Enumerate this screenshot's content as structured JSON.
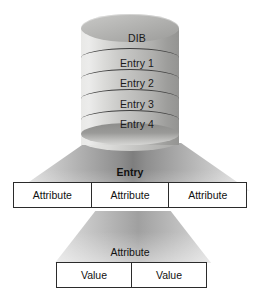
{
  "diagram": {
    "colors": {
      "box_border": "#2b2b2b",
      "box_fill": "#ffffff",
      "text": "#111111",
      "cylinder_light": "#ececeb",
      "cylinder_dark": "#949492",
      "ring_line": "#3d3d3d",
      "funnel_dark": "#7e7e7e",
      "funnel_light": "#ffffff",
      "background": "#ffffff"
    },
    "cylinder": {
      "top_label": "DIB",
      "entries": [
        {
          "label": "Entry 1"
        },
        {
          "label": "Entry 2"
        },
        {
          "label": "Entry 3"
        },
        {
          "label": "Entry 4"
        }
      ]
    },
    "entry_section": {
      "label": "Entry",
      "bold": true,
      "cells": [
        {
          "label": "Attribute"
        },
        {
          "label": "Attribute"
        },
        {
          "label": "Attribute"
        }
      ]
    },
    "attribute_section": {
      "label": "Attribute",
      "bold": false,
      "cells": [
        {
          "label": "Value"
        },
        {
          "label": "Value"
        }
      ]
    }
  }
}
